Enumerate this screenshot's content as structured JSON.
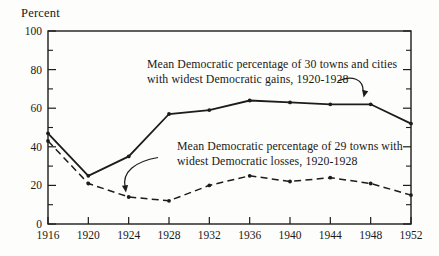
{
  "figure": {
    "background": "#fdfdfc",
    "ink_color": "#1c1c1c"
  },
  "chart_data": {
    "type": "line",
    "title": "",
    "xlabel": "",
    "ylabel": "Percent",
    "xlim": [
      1916,
      1952
    ],
    "ylim": [
      0,
      100
    ],
    "grid": false,
    "frame": "box",
    "legend_position": "inline-annotations",
    "x": [
      1916,
      1920,
      1924,
      1928,
      1932,
      1936,
      1940,
      1944,
      1948,
      1952
    ],
    "xtick_labels": [
      "1916",
      "1920",
      "1924",
      "1928",
      "1932",
      "1936",
      "1940",
      "1944",
      "1948",
      "1952"
    ],
    "ytick_major": [
      0,
      20,
      40,
      60,
      80,
      100
    ],
    "ytick_minor": [
      10,
      30,
      50,
      70,
      90
    ],
    "series": [
      {
        "name": "Mean Democratic percentage of 30 towns and cities with widest Democratic gains, 1920-1928",
        "style": "solid",
        "marker": "dot",
        "values": [
          47,
          25,
          35,
          57,
          59,
          64,
          63,
          62,
          62,
          52
        ]
      },
      {
        "name": "Mean Democratic percentage of 29 towns with widest Democratic losses, 1920-1928",
        "style": "dashed",
        "marker": "dot",
        "values": [
          43,
          21,
          14,
          12,
          20,
          25,
          22,
          24,
          21,
          15
        ]
      }
    ],
    "annotations": [
      {
        "lines": [
          "Mean Democratic percentage of 30 towns and cities",
          "with widest Democratic gains, 1920-1928"
        ],
        "arrow_to": {
          "x": 1948,
          "series": 0
        }
      },
      {
        "lines": [
          "Mean Democratic percentage of 29 towns with",
          "widest Democratic losses, 1920-1928"
        ],
        "arrow_to": {
          "x": 1924,
          "series": 1
        }
      }
    ]
  }
}
